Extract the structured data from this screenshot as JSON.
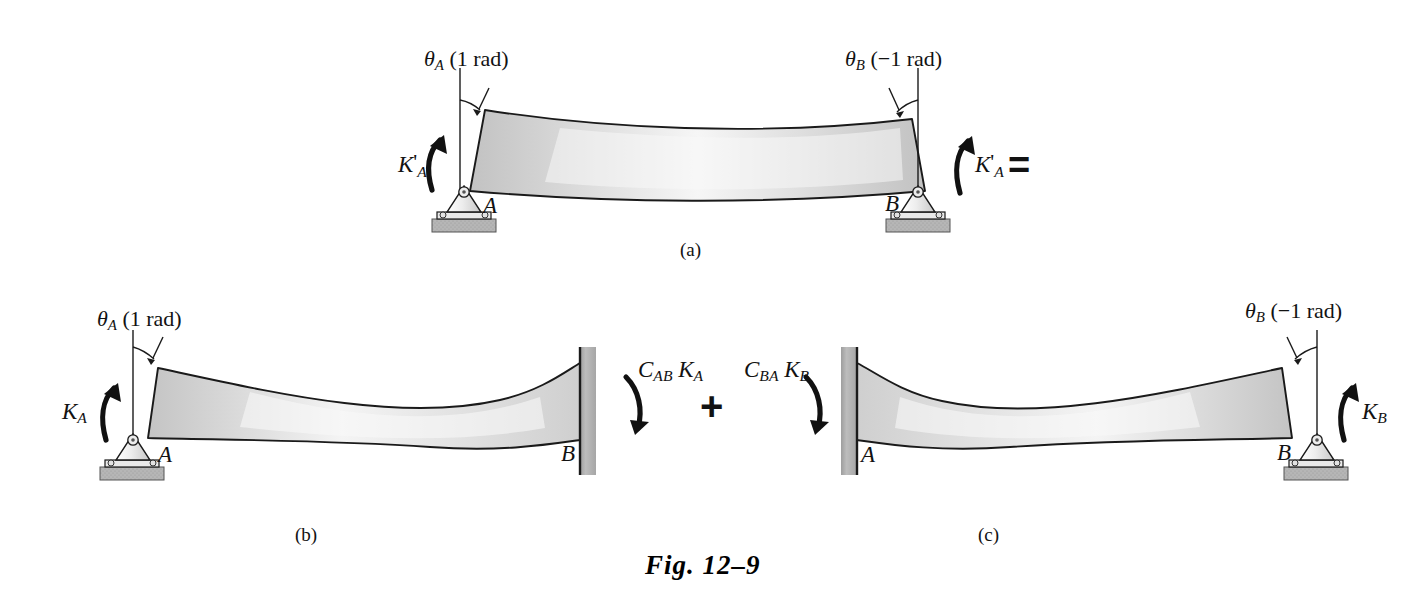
{
  "figure": {
    "caption": "Fig. 12–9",
    "background_color": "#ffffff",
    "ink_color": "#121212",
    "beam_fill_light": "#fbfbfb",
    "beam_fill_mid": "#d6d6d6",
    "beam_fill_dark": "#bdbdbd",
    "support_gray": "#b5b5b5",
    "wall_gray": "#b0b0b0"
  },
  "subfigures": [
    {
      "id": "a",
      "label": "(a)"
    },
    {
      "id": "b",
      "label": "(b)"
    },
    {
      "id": "c",
      "label": "(c)"
    }
  ],
  "operators": {
    "equals": "=",
    "plus": "+"
  },
  "panel_a": {
    "name": "simply-supported-beam-both-ends-rotated",
    "angle_left": {
      "symbol": "θ",
      "subscript": "A",
      "value": "(1 rad)"
    },
    "angle_right": {
      "symbol": "θ",
      "subscript": "B",
      "value": "(−1 rad)"
    },
    "moment_left": {
      "symbol": "K",
      "prime": "'",
      "subscript": "A"
    },
    "moment_right": {
      "symbol": "K",
      "prime": "'",
      "subscript": "A"
    },
    "node_left": "A",
    "node_right": "B",
    "support_left": "pin-support",
    "support_right": "pin-support"
  },
  "panel_b": {
    "name": "beam-pinned-left-fixed-right",
    "angle_left": {
      "symbol": "θ",
      "subscript": "A",
      "value": "(1 rad)"
    },
    "moment_left": {
      "symbol": "K",
      "subscript": "A"
    },
    "moment_right": {
      "symbol": "C",
      "subscript": "AB",
      "symbol2": "K",
      "subscript2": "A"
    },
    "node_left": "A",
    "node_right": "B",
    "support_left": "pin-support",
    "support_right": "fixed-wall-support"
  },
  "panel_c": {
    "name": "beam-fixed-left-pinned-right",
    "angle_right": {
      "symbol": "θ",
      "subscript": "B",
      "value": "(−1 rad)"
    },
    "moment_left": {
      "symbol": "C",
      "subscript": "BA",
      "symbol2": "K",
      "subscript2": "B"
    },
    "moment_right": {
      "symbol": "K",
      "subscript": "B"
    },
    "node_left": "A",
    "node_right": "B",
    "support_left": "fixed-wall-support",
    "support_right": "pin-support"
  }
}
